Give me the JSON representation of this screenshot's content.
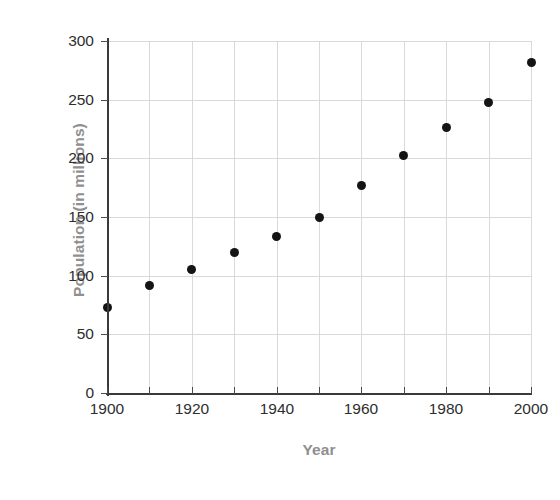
{
  "chart_data": {
    "type": "scatter",
    "title": "",
    "xlabel": "Year",
    "ylabel": "Population (in millions)",
    "x": [
      1900,
      1910,
      1920,
      1930,
      1940,
      1950,
      1960,
      1970,
      1980,
      1990,
      2000
    ],
    "values": [
      73,
      92,
      105,
      120,
      133,
      150,
      177,
      202,
      226,
      248,
      282
    ],
    "series": [
      {
        "name": "Population",
        "values": [
          73,
          92,
          105,
          120,
          133,
          150,
          177,
          202,
          226,
          248,
          282
        ]
      }
    ],
    "xlim": [
      1900,
      2000
    ],
    "ylim": [
      0,
      300
    ],
    "ytick_labels": [
      "0",
      "50",
      "100",
      "150",
      "200",
      "250",
      "300"
    ],
    "ytick_values": [
      0,
      50,
      100,
      150,
      200,
      250,
      300
    ],
    "xtick_labels": [
      "1900",
      "1920",
      "1940",
      "1960",
      "1980",
      "2000"
    ],
    "xtick_values": [
      1900,
      1920,
      1940,
      1960,
      1980,
      2000
    ],
    "xtick_minor_values": [
      1900,
      1910,
      1920,
      1930,
      1940,
      1950,
      1960,
      1970,
      1980,
      1990,
      2000
    ],
    "grid": true,
    "grid_axes": "both",
    "legend": false,
    "legend_position": "none",
    "marker": "filled-circle",
    "marker_color": "#141414",
    "grid_color": "#d9d9d9",
    "axis_color": "#3a3a3a",
    "tick_label_color": "#2e2e2e",
    "axis_title_color": "#8f8f8f",
    "background_color": "#ffffff"
  }
}
